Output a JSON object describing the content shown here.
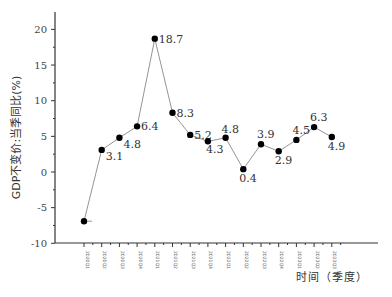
{
  "chart_data": {
    "type": "line",
    "title": "",
    "xlabel": "时间（季度）",
    "ylabel": "GDP不变价:当季同比(%)",
    "ylim": [
      -10,
      23
    ],
    "yticks": [
      -10,
      -5,
      0,
      5,
      10,
      15,
      20
    ],
    "grid": false,
    "legend": null,
    "categories": [
      "2020Q1",
      "2020Q2",
      "2020Q3",
      "2020Q4",
      "2021Q1",
      "2021Q2",
      "2021Q3",
      "2021Q4",
      "2022Q1",
      "2022Q2",
      "2022Q3",
      "2022Q4",
      "2023Q1",
      "2023Q2",
      "2023Q3"
    ],
    "series": [
      {
        "name": "GDP不变价:当季同比",
        "values": [
          -6.9,
          3.1,
          4.8,
          6.4,
          18.7,
          8.3,
          5.2,
          4.3,
          4.8,
          0.4,
          3.9,
          2.9,
          4.5,
          6.3,
          4.9
        ]
      }
    ],
    "data_labels": [
      "",
      "3.1",
      "4.8",
      "6.4",
      "18.7",
      "8.3",
      "5.2",
      "4.3",
      "4.8",
      "0.4",
      "3.9",
      "2.9",
      "4.5",
      "6.3",
      "4.9"
    ],
    "colors": {
      "line": "#888888",
      "marker": "#000000",
      "axis": "#333333"
    }
  }
}
